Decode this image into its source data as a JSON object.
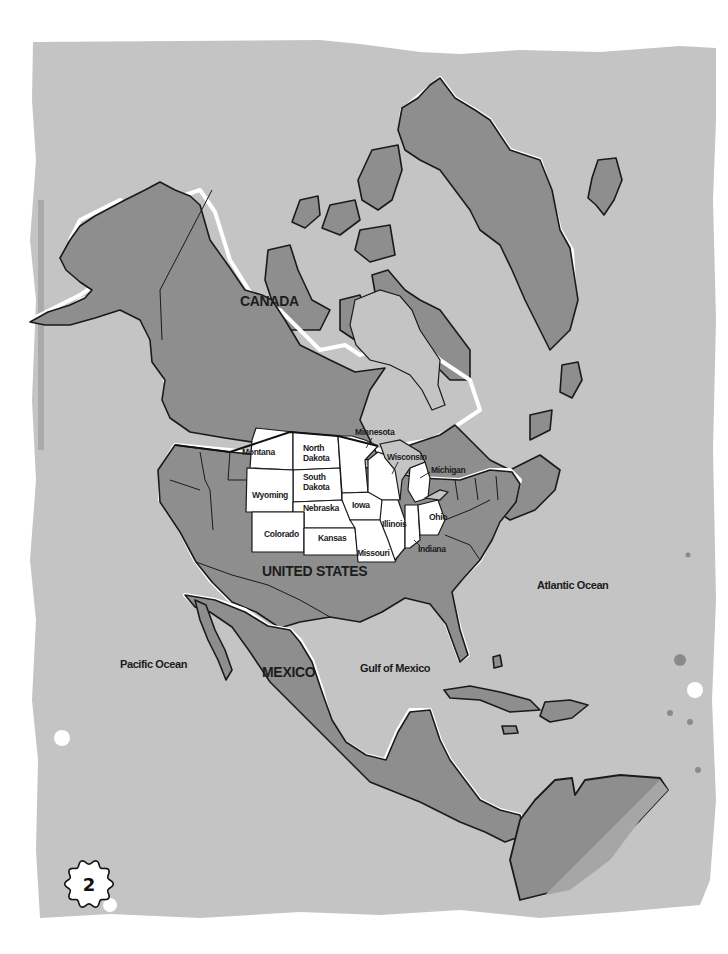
{
  "map": {
    "title": "North America",
    "countries": [
      {
        "name": "CANADA"
      },
      {
        "name": "UNITED STATES"
      },
      {
        "name": "MEXICO"
      }
    ],
    "bodies_of_water": [
      {
        "name": "Pacific Ocean"
      },
      {
        "name": "Atlantic Ocean"
      },
      {
        "name": "Gulf of Mexico"
      }
    ],
    "highlighted_states": [
      {
        "name": "Montana"
      },
      {
        "name": "North Dakota",
        "line1": "North",
        "line2": "Dakota"
      },
      {
        "name": "South Dakota",
        "line1": "South",
        "line2": "Dakota"
      },
      {
        "name": "Wyoming"
      },
      {
        "name": "Nebraska"
      },
      {
        "name": "Colorado"
      },
      {
        "name": "Kansas"
      },
      {
        "name": "Minnesota"
      },
      {
        "name": "Wisconsin"
      },
      {
        "name": "Michigan"
      },
      {
        "name": "Iowa"
      },
      {
        "name": "Illinois"
      },
      {
        "name": "Missouri"
      },
      {
        "name": "Indiana"
      },
      {
        "name": "Ohio"
      }
    ],
    "colors": {
      "ocean": "#c4c4c4",
      "land": "#8e8e8e",
      "highlight": "#ffffff",
      "outline": "#1a1a1a"
    }
  },
  "page": {
    "number": "2"
  }
}
